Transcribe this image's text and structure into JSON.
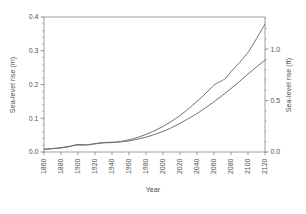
{
  "chart_data": {
    "type": "line",
    "title": "",
    "xlabel": "Year",
    "ylabel": "Sea-level rise (m)",
    "ylabel_right": "Sea-level rise (ft)",
    "xlim": [
      1860,
      2120
    ],
    "ylim": [
      0.0,
      0.4
    ],
    "ylim_right": [
      0.0,
      1.3123
    ],
    "grid": false,
    "legend": "none",
    "xticks": [
      1860,
      1880,
      1900,
      1920,
      1940,
      1960,
      1980,
      2000,
      2020,
      2040,
      2060,
      2080,
      2100,
      2120
    ],
    "xtick_labels": [
      "1860",
      "1880",
      "1900",
      "1920",
      "1940",
      "1960",
      "1980",
      "2000",
      "2020",
      "2040",
      "2060",
      "2080",
      "2100",
      "2120"
    ],
    "yticks": [
      0.0,
      0.1,
      0.2,
      0.3,
      0.4
    ],
    "ytick_labels": [
      "0.0",
      "0.1",
      "0.2",
      "0.3",
      "0.4"
    ],
    "yticks_right": [
      0.0,
      0.5,
      1.0
    ],
    "ytick_labels_right": [
      "0.0",
      "0.5",
      "1.0"
    ],
    "ytick_minor_step": 0.02,
    "line_color": "#6f6a68",
    "axis_color": "#8a8684",
    "series": [
      {
        "name": "upper-scenario",
        "x": [
          1860,
          1870,
          1880,
          1890,
          1895,
          1900,
          1905,
          1910,
          1915,
          1920,
          1930,
          1940,
          1950,
          1960,
          1970,
          1980,
          1990,
          2000,
          2010,
          2020,
          2030,
          2040,
          2050,
          2060,
          2065,
          2070,
          2075,
          2080,
          2085,
          2090,
          2100,
          2110,
          2120
        ],
        "values": [
          0.008,
          0.01,
          0.012,
          0.016,
          0.019,
          0.022,
          0.022,
          0.021,
          0.022,
          0.024,
          0.027,
          0.028,
          0.031,
          0.036,
          0.043,
          0.052,
          0.063,
          0.076,
          0.091,
          0.108,
          0.128,
          0.15,
          0.173,
          0.198,
          0.206,
          0.212,
          0.222,
          0.238,
          0.252,
          0.265,
          0.295,
          0.336,
          0.379
        ]
      },
      {
        "name": "lower-scenario",
        "x": [
          1860,
          1870,
          1880,
          1890,
          1895,
          1900,
          1905,
          1910,
          1915,
          1920,
          1930,
          1940,
          1950,
          1960,
          1970,
          1980,
          1990,
          2000,
          2010,
          2020,
          2030,
          2040,
          2050,
          2060,
          2070,
          2080,
          2090,
          2100,
          2110,
          2120
        ],
        "values": [
          0.008,
          0.01,
          0.013,
          0.017,
          0.02,
          0.021,
          0.02,
          0.021,
          0.023,
          0.025,
          0.028,
          0.029,
          0.03,
          0.033,
          0.038,
          0.044,
          0.052,
          0.061,
          0.072,
          0.085,
          0.099,
          0.114,
          0.131,
          0.149,
          0.168,
          0.188,
          0.209,
          0.231,
          0.252,
          0.272
        ]
      }
    ]
  }
}
